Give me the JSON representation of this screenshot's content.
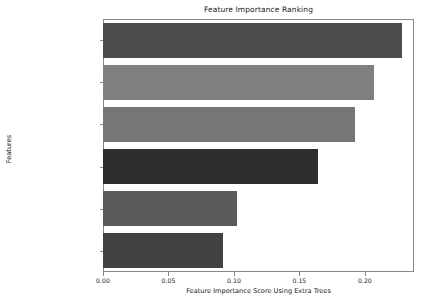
{
  "chart_data": {
    "type": "bar",
    "orientation": "horizontal",
    "title": "Feature Importance Ranking",
    "xlabel": "Feature Importance Score Using Extra Trees",
    "ylabel": "Features",
    "categories": [
      "Thickness_ft",
      "Effective Porosity_Fraction",
      "Clay Volume_ Fraction",
      "Bulk Density_gg per cc",
      "Resistivity_ohmsm",
      "Water Saturation_Fraction"
    ],
    "values": [
      0.2285,
      0.2068,
      0.1923,
      0.1641,
      0.1023,
      0.0916
    ],
    "bar_colors": [
      "#4c4c4c",
      "#808080",
      "#767676",
      "#2e2e2e",
      "#5a5a5a",
      "#414141"
    ],
    "xlim": [
      0.0,
      0.2375
    ],
    "ylim_order": "descending",
    "xticks": [
      0.0,
      0.05,
      0.1,
      0.15,
      0.2
    ],
    "xtick_labels": [
      "0.00",
      "0.05",
      "0.10",
      "0.15",
      "0.20"
    ],
    "grid": false,
    "legend": null
  }
}
